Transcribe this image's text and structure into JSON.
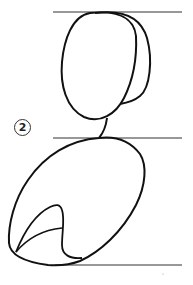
{
  "figure": {
    "step_number": "2",
    "colors": {
      "ink": "#111111",
      "guide_line": "#333333",
      "background": "#ffffff"
    },
    "guide_lines": [
      {
        "name": "top-guide-line",
        "y": 12
      },
      {
        "name": "middle-guide-line",
        "y": 138
      },
      {
        "name": "bottom-guide-line",
        "y": 265
      }
    ],
    "parts": [
      "head-front-oval",
      "head-back-oval",
      "neck",
      "body-egg",
      "inner-flap"
    ]
  }
}
